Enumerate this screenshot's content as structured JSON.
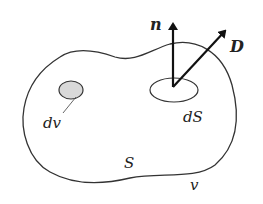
{
  "diagram": {
    "type": "vector-field-surface-volume",
    "labels": {
      "normal_vector": "n",
      "field_vector": "D",
      "surface_element": "dS",
      "volume_element": "dv",
      "surface": "S",
      "volume": "v"
    },
    "colors": {
      "outline": "#333333",
      "arrow": "#111111",
      "volume_element_fill": "#d9d9d9",
      "background": "#ffffff"
    }
  }
}
